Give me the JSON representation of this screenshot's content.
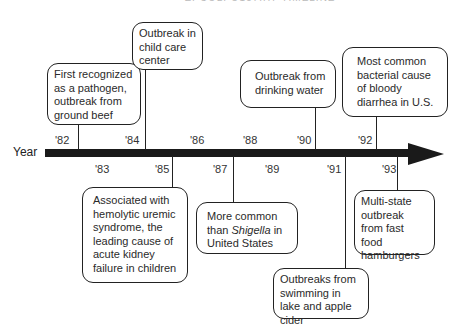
{
  "title": "E. COLI O157:H7 TIMELINE",
  "axis": {
    "label": "Year",
    "top_ticks": [
      "'82",
      "'84",
      "'86",
      "'88",
      "'90",
      "'92"
    ],
    "bottom_ticks": [
      "'83",
      "'85",
      "'87",
      "'89",
      "'91",
      "'93"
    ]
  },
  "events": {
    "e1982": {
      "year": "1982",
      "text": "First recognized as a pathogen, outbreak from ground beef"
    },
    "e1984": {
      "year": "1984",
      "text": "Outbreak in child care center"
    },
    "e1985": {
      "year": "1985",
      "text": "Associated with hemolytic uremic syndrome, the leading cause of acute kidney failure in children"
    },
    "e1987": {
      "year": "1987",
      "text_before": "More common than ",
      "text_italic": "Shigella",
      "text_after": " in United States"
    },
    "e1990": {
      "year": "1990",
      "text": "Outbreak from drinking water"
    },
    "e1991": {
      "year": "1991",
      "text": "Outbreaks from swimming in lake and apple cider"
    },
    "e1992": {
      "year": "1992",
      "text": "Most common bacterial cause of bloody diarrhea in U.S."
    },
    "e1993": {
      "year": "1993",
      "text": "Multi-state outbreak from fast food hamburgers"
    }
  }
}
